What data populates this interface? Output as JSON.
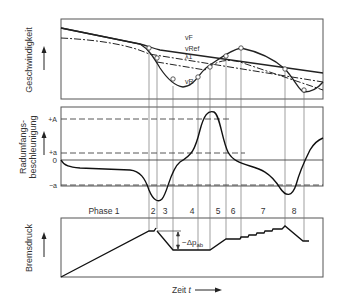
{
  "diagram": {
    "type": "ABS braking control cycle",
    "panels": [
      {
        "id": "speed",
        "ylabel": "Geschwindigkeit",
        "curves": {
          "vF": "vF",
          "vRef": "vRef",
          "lambda1": "λ1",
          "vR": "vR"
        }
      },
      {
        "id": "acceleration",
        "ylabel_line1": "Radumfangs-",
        "ylabel_line2": "beschleunigung",
        "levels": {
          "plusA": "+A",
          "plusa": "+a",
          "zero": "0",
          "minusa": "−a"
        }
      },
      {
        "id": "pressure",
        "ylabel": "Bremsdruck",
        "annotation": "−Δp",
        "annotation_sub": "ab"
      }
    ],
    "phases": [
      "Phase 1",
      "2",
      "3",
      "4",
      "5",
      "6",
      "7",
      "8"
    ],
    "xlabel": "Zeit",
    "xlabel_var": "t"
  }
}
